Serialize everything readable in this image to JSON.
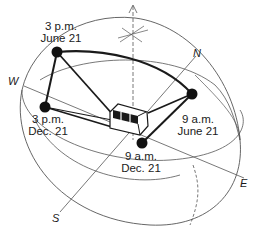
{
  "diagram": {
    "type": "sun-path-hemisphere",
    "points": [
      {
        "id": "pm3_jun21",
        "time": "3 p.m.",
        "date": "June 21"
      },
      {
        "id": "am9_jun21",
        "time": "9 a.m.",
        "date": "June 21"
      },
      {
        "id": "pm3_dec21",
        "time": "3 p.m.",
        "date": "Dec. 21"
      },
      {
        "id": "am9_dec21",
        "time": "9 a.m.",
        "date": "Dec. 21"
      }
    ],
    "directions": {
      "north": "N",
      "south": "S",
      "east": "E",
      "west": "W"
    },
    "colors": {
      "line": "#1a1a1a",
      "thin_line": "#555555",
      "dot": "#111111",
      "background": "#ffffff"
    }
  }
}
